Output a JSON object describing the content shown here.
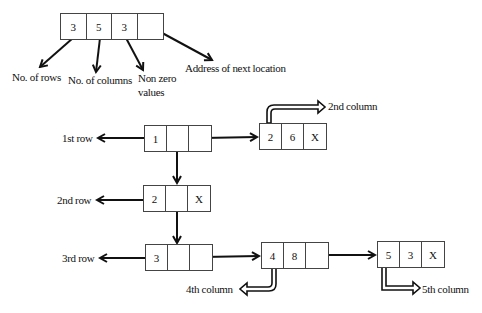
{
  "header_node": {
    "cells": [
      "3",
      "5",
      "3",
      ""
    ],
    "annotations": {
      "rows": "No. of rows",
      "columns": "No. of columns",
      "nonzero_line1": "Non zero",
      "nonzero_line2": "values",
      "next": "Address of next location"
    }
  },
  "rows": [
    {
      "label": "1st row",
      "head_cells": [
        "1",
        "",
        ""
      ],
      "elements": [
        {
          "cells": [
            "2",
            "6",
            "X"
          ],
          "column_label": "2nd column"
        }
      ]
    },
    {
      "label": "2nd row",
      "head_cells": [
        "2",
        "",
        "X"
      ],
      "elements": []
    },
    {
      "label": "3rd row",
      "head_cells": [
        "3",
        "",
        ""
      ],
      "elements": [
        {
          "cells": [
            "4",
            "8",
            ""
          ],
          "column_label": "4th column"
        },
        {
          "cells": [
            "5",
            "3",
            "X"
          ],
          "column_label": "5th column"
        }
      ]
    }
  ],
  "colors": {
    "stroke": "#111111",
    "box_border": "#444444",
    "background": "#ffffff"
  }
}
